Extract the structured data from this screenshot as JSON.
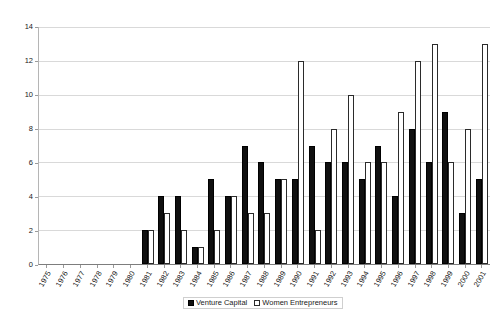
{
  "chart_data": {
    "type": "bar",
    "title": "",
    "subtitle": "",
    "xlabel": "",
    "ylabel": "",
    "ylim": [
      0,
      14
    ],
    "yticks": [
      0,
      2,
      4,
      6,
      8,
      10,
      12,
      14
    ],
    "grid": true,
    "legend_position": "bottom",
    "categories": [
      "1975",
      "1976",
      "1977",
      "1978",
      "1979",
      "1980",
      "1981",
      "1982",
      "1983",
      "1984",
      "1985",
      "1986",
      "1987",
      "1988",
      "1989",
      "1990",
      "1991",
      "1992",
      "1993",
      "1994",
      "1995",
      "1996",
      "1997",
      "1998",
      "1999",
      "2000",
      "2001"
    ],
    "series": [
      {
        "name": "Venture Capital",
        "color": "#101010",
        "values": [
          0,
          0,
          0,
          0,
          0,
          0,
          2,
          4,
          4,
          1,
          5,
          4,
          7,
          6,
          5,
          5,
          7,
          6,
          6,
          5,
          7,
          4,
          8,
          6,
          9,
          3,
          5
        ]
      },
      {
        "name": "Women Entrepreneurs",
        "color": "#ffffff",
        "values": [
          0,
          0,
          0,
          0,
          0,
          0,
          2,
          3,
          2,
          1,
          2,
          4,
          3,
          3,
          5,
          12,
          2,
          8,
          10,
          6,
          6,
          9,
          12,
          13,
          6,
          8,
          13
        ]
      }
    ]
  }
}
